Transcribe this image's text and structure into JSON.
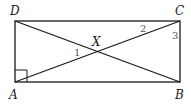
{
  "diagram": {
    "type": "rectangle-with-diagonals",
    "colors": {
      "line": "#1a1a1a",
      "angle_numbers": "#555555",
      "background": "#ffffff"
    },
    "vertices": [
      {
        "name": "D",
        "x": 15,
        "y": 21,
        "label_x": 10,
        "label_y": 15
      },
      {
        "name": "C",
        "x": 180,
        "y": 21,
        "label_x": 175,
        "label_y": 15
      },
      {
        "name": "A",
        "x": 15,
        "y": 82,
        "label_x": 9,
        "label_y": 99
      },
      {
        "name": "B",
        "x": 180,
        "y": 82,
        "label_x": 175,
        "label_y": 99
      }
    ],
    "intersection": {
      "name": "X",
      "x": 97,
      "y": 51,
      "label_x": 92,
      "label_y": 46
    },
    "angle_labels": [
      {
        "text": "1",
        "x": 74,
        "y": 56
      },
      {
        "text": "2",
        "x": 140,
        "y": 32
      },
      {
        "text": "3",
        "x": 172,
        "y": 39
      }
    ],
    "right_angle_marker": {
      "vertex": "A",
      "size": 12
    }
  }
}
